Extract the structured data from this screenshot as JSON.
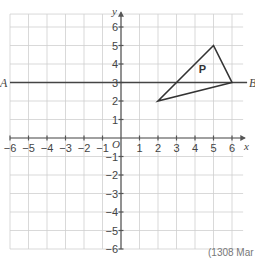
{
  "diagram": {
    "type": "coordinate-grid",
    "axes": {
      "x_label": "x",
      "y_label": "y",
      "origin_label": "O",
      "x_range": [
        -6,
        6
      ],
      "y_range": [
        -6,
        6
      ],
      "x_ticks": [
        "-6",
        "-5",
        "-4",
        "-3",
        "-2",
        "-1",
        "1",
        "2",
        "3",
        "4",
        "5",
        "6"
      ],
      "y_ticks": [
        "6",
        "5",
        "4",
        "3",
        "2",
        "1",
        "-1",
        "-2",
        "-3",
        "-4",
        "-5",
        "-6"
      ]
    },
    "line": {
      "equation": "y = 3",
      "start_label": "A",
      "end_label": "B"
    },
    "shape": {
      "label": "P",
      "vertices": [
        [
          5,
          5
        ],
        [
          6,
          3
        ],
        [
          2,
          2
        ]
      ]
    },
    "footer_text": "(1308 Mar"
  }
}
